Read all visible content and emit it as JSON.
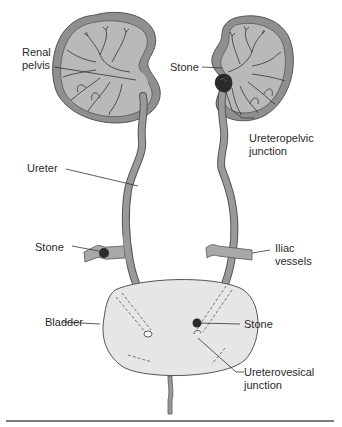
{
  "figure": {
    "colors": {
      "cortex": "#8f8f8f",
      "medulla": "#b9b9b9",
      "ureter": "#9a9a9a",
      "bladder": "#e6e6e6",
      "vessel": "#a8a8a8",
      "stone": "#2b2b2b",
      "line": "#333333",
      "rule": "#7a7a7a"
    },
    "labels": {
      "renal_pelvis": "Renal\npelvis",
      "stone_upj": "Stone",
      "ureteropelvic_junction": "Ureteropelvic\njunction",
      "ureter": "Ureter",
      "stone_iliac": "Stone",
      "iliac_vessels": "Iliac\nvessels",
      "bladder": "Bladder",
      "stone_uvj": "Stone",
      "ureterovesical_junction": "Ureterovesical\njunction"
    }
  }
}
